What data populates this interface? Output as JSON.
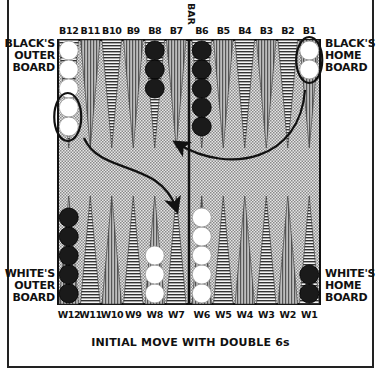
{
  "labels": {
    "black_outer_board": [
      "BLACK'S",
      "OUTER",
      "BOARD"
    ],
    "black_home_board": [
      "BLACK'S",
      "HOME",
      "BOARD"
    ],
    "white_outer_board": [
      "WHITE'S",
      "OUTER",
      "BOARD"
    ],
    "white_home_board": [
      "WHITE'S",
      "HOME",
      "BOARD"
    ],
    "bar": "BAR",
    "caption": "INITIAL MOVE WITH DOUBLE 6s"
  },
  "top_points": [
    "B12",
    "B11",
    "B10",
    "B9",
    "B8",
    "B7",
    "B6",
    "B5",
    "B4",
    "B3",
    "B2",
    "B1"
  ],
  "bottom_points": [
    "W12",
    "W11",
    "W10",
    "W9",
    "W8",
    "W7",
    "W6",
    "W5",
    "W4",
    "W3",
    "W2",
    "W1"
  ],
  "checkers": {
    "top": [
      {
        "point": "B12",
        "color": "white",
        "count": 5
      },
      {
        "point": "B8",
        "color": "black",
        "count": 3
      },
      {
        "point": "B6",
        "color": "black",
        "count": 5
      },
      {
        "point": "B1",
        "color": "white",
        "count": 2
      }
    ],
    "bottom": [
      {
        "point": "W12",
        "color": "black",
        "count": 5
      },
      {
        "point": "W8",
        "color": "white",
        "count": 3
      },
      {
        "point": "W6",
        "color": "white",
        "count": 5
      },
      {
        "point": "W1",
        "color": "black",
        "count": 2
      }
    ]
  },
  "highlights": [
    {
      "point": "B1",
      "description": "circled pair of white checkers"
    },
    {
      "point": "B12",
      "description": "circled lower two white checkers"
    }
  ],
  "arrows": [
    {
      "from": "B1",
      "to": "B7",
      "description": "curved arrow from B1 to B7"
    },
    {
      "from": "B12",
      "to": "W7",
      "description": "curved arrow from B12 to W7"
    }
  ],
  "colors": {
    "board": "#d8d8d8",
    "ink": "#111111",
    "white_checker": "#ffffff",
    "black_checker": "#1a1a1a"
  }
}
